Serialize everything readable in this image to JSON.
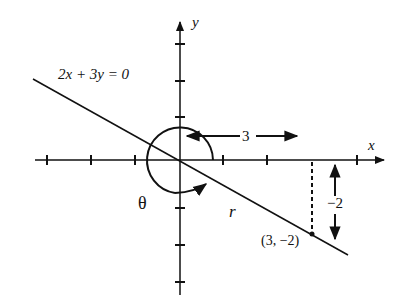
{
  "diagram": {
    "equation": "2x + 3y = 0",
    "x_axis_label": "x",
    "y_axis_label": "y",
    "point_label": "(3, −2)",
    "horizontal_distance_label": "3",
    "vertical_distance_label": "−2",
    "angle_label": "θ",
    "radius_label": "r",
    "colors": {
      "ink": "#111111",
      "background": "#ffffff"
    }
  }
}
